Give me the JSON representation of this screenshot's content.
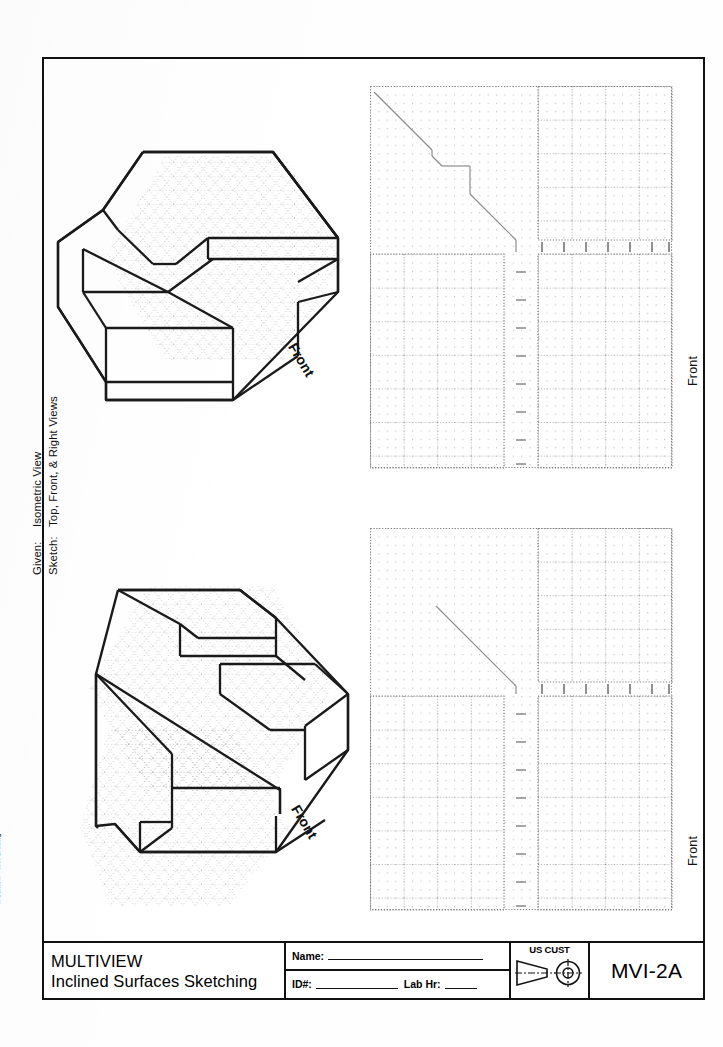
{
  "sheet": {
    "edge_note": "T. Sexton ● MVI-2A.dwg",
    "width": 723,
    "height": 1047,
    "ink_color": "#111111",
    "grid_color": "#9a9a9a"
  },
  "instructions": {
    "given_label": "Given:",
    "given_value": "Isometric View",
    "sketch_label": "Sketch:",
    "sketch_value": "Top, Front, & Right Views"
  },
  "problems": [
    {
      "id": "problem-1",
      "figure_label": "Front",
      "grid_view_label": "Front"
    },
    {
      "id": "problem-2",
      "figure_label": "Front",
      "grid_view_label": "Front"
    }
  ],
  "title_block": {
    "subject": "MULTIVIEW",
    "topic": "Inclined Surfaces Sketching",
    "name_label": "Name:",
    "id_label": "ID#:",
    "lab_hr_label": "Lab Hr:",
    "projection_label": "US CUST",
    "sheet_code": "MVI-2A"
  }
}
